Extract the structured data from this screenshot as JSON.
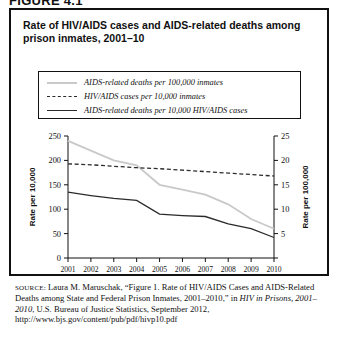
{
  "figure": {
    "number_label": "FIGURE 4.1",
    "title": "Rate of HIV/AIDS cases and AIDS-related deaths among prison inmates, 2001–10"
  },
  "legend": {
    "items": [
      {
        "label": "AIDS-related deaths per 100,000 inmates",
        "style": "solid-light",
        "color": "#c9c9c9"
      },
      {
        "label": "HIV/AIDS cases per 10,000 inmates",
        "style": "dashed",
        "color": "#2b2b2b"
      },
      {
        "label": "AIDS-related deaths per 10,000 HIV/AIDS cases",
        "style": "solid-dark",
        "color": "#2b2b2b"
      }
    ]
  },
  "axes": {
    "left_title": "Rate per 10,000",
    "right_title": "Rate per 100,000",
    "left_ticks": [
      "0",
      "50",
      "100",
      "150",
      "200",
      "250"
    ],
    "right_ticks": [
      "0",
      "5",
      "10",
      "15",
      "20",
      "25"
    ],
    "x_ticks": [
      "2001",
      "2002",
      "2003",
      "2004",
      "2005",
      "2006",
      "2007",
      "2008",
      "2009",
      "2010"
    ]
  },
  "source": {
    "label": "SOURCE:",
    "line1": " Laura M. Maruschak, “Figure 1. Rate of HIV/AIDS Cases and AIDS-Related Deaths among State and Federal Prison Inmates, 2001–2010,” in ",
    "italic1": "HIV in Prisons, 2001–2010",
    "line2": ", U.S. Bureau of Justice Statistics, September 2012, http://www.bjs.gov/content/pub/pdf/hivp10.pdf"
  },
  "chart_data": {
    "type": "line",
    "title": "Rate of HIV/AIDS cases and AIDS-related deaths among prison inmates, 2001–10",
    "xlabel": "",
    "ylabel": "Rate per 10,000",
    "y2label": "Rate per 100,000",
    "x": [
      "2001",
      "2002",
      "2003",
      "2004",
      "2005",
      "2006",
      "2007",
      "2008",
      "2009",
      "2010"
    ],
    "ylim": [
      0,
      250
    ],
    "y2lim": [
      0,
      25
    ],
    "grid": false,
    "legend_position": "above-plot",
    "series": [
      {
        "name": "AIDS-related deaths per 100,000 inmates",
        "axis": "right",
        "color": "#c9c9c9",
        "linestyle": "solid",
        "values": [
          24,
          22,
          20,
          19,
          15,
          14,
          13,
          11,
          8,
          6
        ]
      },
      {
        "name": "HIV/AIDS cases per 10,000 inmates",
        "axis": "left",
        "color": "#2b2b2b",
        "linestyle": "dashed",
        "values": [
          193,
          191,
          188,
          185,
          183,
          180,
          177,
          174,
          171,
          168
        ]
      },
      {
        "name": "AIDS-related deaths per 10,000 HIV/AIDS cases",
        "axis": "left",
        "color": "#2b2b2b",
        "linestyle": "solid",
        "values": [
          135,
          128,
          122,
          118,
          90,
          87,
          85,
          70,
          60,
          42
        ]
      }
    ]
  }
}
